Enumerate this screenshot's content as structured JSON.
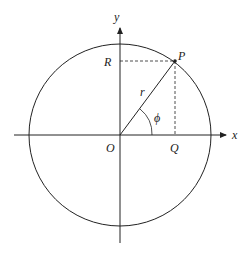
{
  "diagram": {
    "type": "polar-coordinates-circle",
    "labels": {
      "x_axis": "x",
      "y_axis": "y",
      "origin": "O",
      "point": "P",
      "y_projection": "R",
      "x_projection": "Q",
      "radius": "r",
      "angle": "ϕ"
    },
    "colors": {
      "stroke": "#222222",
      "background": "#ffffff"
    }
  }
}
